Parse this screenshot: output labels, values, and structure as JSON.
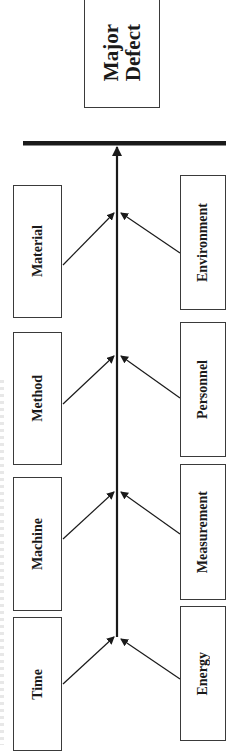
{
  "effect": {
    "label_line1": "Major",
    "label_line2": "Defect"
  },
  "causes_left": [
    {
      "label": "Material"
    },
    {
      "label": "Method"
    },
    {
      "label": "Machine"
    },
    {
      "label": "Time"
    }
  ],
  "causes_right": [
    {
      "label": "Environment"
    },
    {
      "label": "Personnel"
    },
    {
      "label": "Measurement"
    },
    {
      "label": "Energy"
    }
  ],
  "colors": {
    "line": "#1a1a1a",
    "box_border": "#3a3a3a",
    "text": "#1a1a1a",
    "background": "#ffffff"
  }
}
